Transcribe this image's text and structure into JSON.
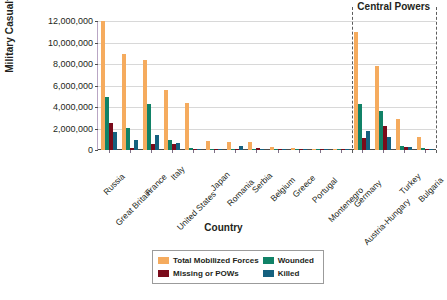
{
  "chart_data": {
    "type": "bar",
    "title": "",
    "xlabel": "Country",
    "ylabel": "Military Casualties",
    "ylim": [
      0,
      12000000
    ],
    "yticks": [
      "0",
      "2,000,000",
      "4,000,000",
      "6,000,000",
      "8,000,000",
      "10,000,000",
      "12,000,000"
    ],
    "ytick_values": [
      0,
      2000000,
      4000000,
      6000000,
      8000000,
      10000000,
      12000000
    ],
    "grid": true,
    "legend_position": "bottom",
    "categories": [
      "Russia",
      "Great Britain",
      "France",
      "Italy",
      "United States",
      "Japan",
      "Romania",
      "Serbia",
      "Belgium",
      "Greece",
      "Portugal",
      "Montenegro",
      "Germany",
      "Austria-Hungary",
      "Turkey",
      "Bulgaria"
    ],
    "series": [
      {
        "name": "Total Mobilized Forces",
        "color": "#f5ab5e",
        "values": [
          12000000,
          8904467,
          8410000,
          5615000,
          4355000,
          800000,
          750000,
          707343,
          267000,
          230000,
          100000,
          50000,
          11000000,
          7800000,
          2850000,
          1200000
        ]
      },
      {
        "name": "Wounded",
        "color": "#118267",
        "values": [
          4950000,
          2090212,
          4266000,
          947000,
          204002,
          907,
          120000,
          133148,
          44686,
          21000,
          13751,
          10000,
          4247143,
          3620000,
          400000,
          152390
        ]
      },
      {
        "name": "Missing or POWs",
        "color": "#7a0b1b",
        "values": [
          2500000,
          191652,
          537000,
          600000,
          4500,
          3,
          80000,
          152958,
          34659,
          1000,
          12318,
          7000,
          1152800,
          2200000,
          250000,
          27029
        ]
      },
      {
        "name": "Killed",
        "color": "#15617f",
        "values": [
          1700000,
          908371,
          1357800,
          650000,
          116516,
          300,
          335706,
          45000,
          13716,
          5000,
          7222,
          3000,
          1773700,
          1200000,
          325000,
          87500
        ]
      }
    ],
    "annotations": [
      {
        "text": "Central Powers",
        "after_category": "Montenegro"
      }
    ]
  },
  "legend": {
    "entries": [
      {
        "label": "Total Mobilized Forces",
        "color": "#f5ab5e"
      },
      {
        "label": "Wounded",
        "color": "#118267"
      },
      {
        "label": "Missing or POWs",
        "color": "#7a0b1b"
      },
      {
        "label": "Killed",
        "color": "#15617f"
      }
    ]
  }
}
